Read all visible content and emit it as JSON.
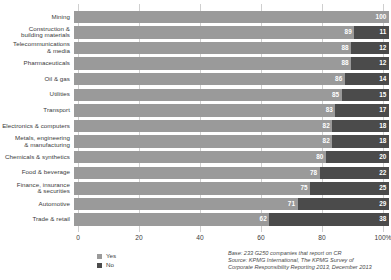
{
  "chart_data": {
    "type": "bar",
    "orientation": "horizontal",
    "stacked": true,
    "title": "",
    "subtitle": "",
    "xlabel": "",
    "ylabel": "",
    "xlim": [
      0,
      100
    ],
    "grid": true,
    "legend_position": "bottom-left",
    "xticks": [
      "0",
      "20",
      "40",
      "60",
      "80",
      "100%"
    ],
    "xtick_values": [
      0,
      20,
      40,
      60,
      80,
      100
    ],
    "legend": [
      "Yes",
      "No"
    ],
    "colors": {
      "yes": "#9a9a9a",
      "no": "#4b4b4b",
      "gridline": "#cfcfcf",
      "text": "#3a3a3a",
      "value_text": "#ffffff"
    },
    "categories": [
      "Mining",
      "Construction & building materials",
      "Telecommunications & media",
      "Pharmaceuticals",
      "Oil & gas",
      "Utilities",
      "Transport",
      "Electronics & computers",
      "Metals, engineering & manufacturing",
      "Chemicals & synthetics",
      "Food & beverage",
      "Finance, insurance & securities",
      "Automotive",
      "Trade & retail"
    ],
    "category_lines": [
      [
        "Mining"
      ],
      [
        "Construction &",
        "building materials"
      ],
      [
        "Telecommunications",
        "& media"
      ],
      [
        "Pharmaceuticals"
      ],
      [
        "Oil & gas"
      ],
      [
        "Utilities"
      ],
      [
        "Transport"
      ],
      [
        "Electronics & computers"
      ],
      [
        "Metals, engineering",
        "& manufacturing"
      ],
      [
        "Chemicals & synthetics"
      ],
      [
        "Food & beverage"
      ],
      [
        "Finance, insurance",
        "& securities"
      ],
      [
        "Automotive"
      ],
      [
        "Trade & retail"
      ]
    ],
    "series": [
      {
        "name": "Yes",
        "values": [
          100,
          89,
          88,
          88,
          86,
          85,
          83,
          82,
          82,
          80,
          78,
          75,
          71,
          62
        ]
      },
      {
        "name": "No",
        "values": [
          0,
          11,
          12,
          12,
          14,
          15,
          17,
          18,
          18,
          20,
          22,
          25,
          29,
          38
        ]
      }
    ],
    "annotations": {
      "base": "Base: 233 G250 companies that report on CR",
      "source_line1": "Source: KPMG International, The KPMG Survey of",
      "source_line2": "Corporate Responsibility Reporting 2013, December 2013"
    }
  }
}
